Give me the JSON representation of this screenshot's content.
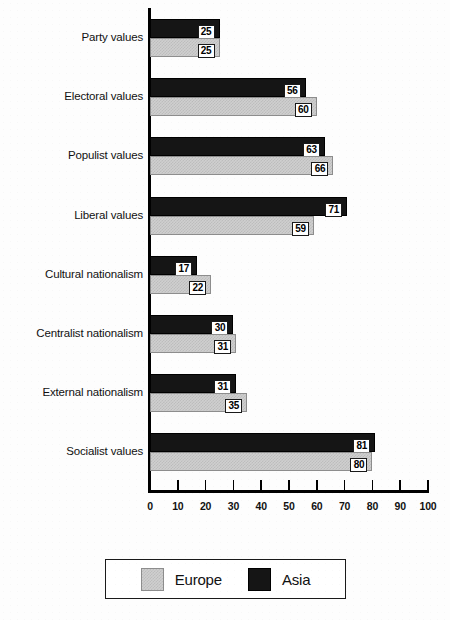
{
  "chart_data": {
    "type": "bar",
    "orientation": "horizontal",
    "title": "",
    "subtitle": "",
    "xlabel": "",
    "ylabel": "",
    "xlim": [
      0,
      100
    ],
    "xticks": [
      0,
      10,
      20,
      30,
      40,
      50,
      60,
      70,
      80,
      90,
      100
    ],
    "xtick_labels": [
      "0",
      "10",
      "20",
      "30",
      "40",
      "50",
      "60",
      "70",
      "80",
      "90",
      "100"
    ],
    "grid": false,
    "legend_position": "bottom-center",
    "show_value_labels": true,
    "categories": [
      "Party values",
      "Electoral values",
      "Populist values",
      "Liberal values",
      "Cultural nationalism",
      "Centralist nationalism",
      "External nationalism",
      "Socialist values"
    ],
    "series": [
      {
        "name": "Asia",
        "color": "#151515",
        "values": [
          25,
          56,
          63,
          71,
          17,
          30,
          31,
          81
        ],
        "value_labels": [
          "25",
          "56",
          "63",
          "71",
          "17",
          "30",
          "31",
          "81"
        ]
      },
      {
        "name": "Europe",
        "color": "#cfcfcf",
        "values": [
          25,
          60,
          66,
          59,
          22,
          31,
          35,
          80
        ],
        "value_labels": [
          "25",
          "60",
          "66",
          "59",
          "22",
          "31",
          "35",
          "80"
        ]
      }
    ]
  },
  "legend": {
    "entries": [
      {
        "label": "Europe",
        "swatch": "europe-swatch"
      },
      {
        "label": "Asia",
        "swatch": "asia-swatch"
      }
    ]
  }
}
